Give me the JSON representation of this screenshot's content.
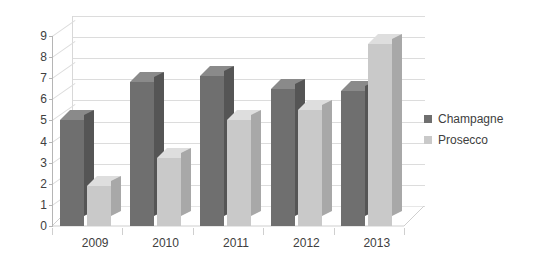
{
  "chart_data": {
    "type": "bar",
    "title": "",
    "subtitle": "",
    "xlabel": "",
    "ylabel": "",
    "categories": [
      "2009",
      "2010",
      "2011",
      "2012",
      "2013"
    ],
    "series": [
      {
        "name": "Champagne",
        "color": "#6f6f6f",
        "values": [
          5.0,
          6.8,
          7.1,
          6.5,
          6.4
        ]
      },
      {
        "name": "Prosecco",
        "color": "#c9c9c9",
        "values": [
          1.9,
          3.2,
          5.0,
          5.5,
          8.6
        ]
      }
    ],
    "ylim": [
      0,
      9
    ],
    "ytick_labels": [
      "0",
      "1",
      "2",
      "3",
      "4",
      "5",
      "6",
      "7",
      "8",
      "9"
    ],
    "ytick_values": [
      0,
      1,
      2,
      3,
      4,
      5,
      6,
      7,
      8,
      9
    ],
    "grid": true,
    "grid_orientation": "horizontal",
    "legend_position": "right",
    "style": "3d-clustered-column",
    "background": "#ffffff",
    "gridline_color": "#dcdcdc",
    "axis_color": "#b5b5b5",
    "text_color": "#404040"
  },
  "legend": {
    "items": [
      {
        "label": "Champagne",
        "swatch": "dark"
      },
      {
        "label": "Prosecco",
        "swatch": "light"
      }
    ]
  }
}
